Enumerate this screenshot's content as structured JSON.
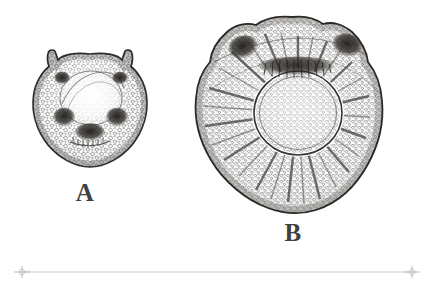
{
  "plate": {
    "background_color": "#ffffff",
    "ink_color": "#3d3b39",
    "width": 434,
    "height": 291,
    "medium": "engraving",
    "subject": "two cellular cross-sections"
  },
  "figures": [
    {
      "id": "A",
      "label": "A",
      "label_x": 85,
      "label_y": 193,
      "center_x": 90,
      "center_y": 114,
      "radius_x": 56,
      "radius_y": 60,
      "outline": "rounded body with two horn-like protrusions at the upper left and upper right",
      "texture": "dense stippled cellular parenchyma",
      "features": [
        {
          "name": "left-ocellus",
          "cx": 62,
          "cy": 78,
          "rx": 7,
          "ry": 6,
          "tone": "dark"
        },
        {
          "name": "right-ocellus",
          "cx": 120,
          "cy": 78,
          "rx": 7,
          "ry": 6,
          "tone": "dark"
        },
        {
          "name": "left-lobe",
          "cx": 64,
          "cy": 117,
          "rx": 10,
          "ry": 9,
          "tone": "dark"
        },
        {
          "name": "right-lobe",
          "cx": 117,
          "cy": 117,
          "rx": 10,
          "ry": 9,
          "tone": "dark"
        },
        {
          "name": "basal-mass",
          "cx": 90,
          "cy": 131,
          "rx": 14,
          "ry": 9,
          "tone": "dark"
        },
        {
          "name": "central-dome",
          "cx": 91,
          "cy": 98,
          "rx": 31,
          "ry": 27,
          "tone": "light"
        }
      ]
    },
    {
      "id": "B",
      "label": "B",
      "label_x": 293,
      "label_y": 233,
      "center_x": 292,
      "center_y": 115,
      "radius_x": 84,
      "radius_y": 100,
      "outline": "large lobed subcircular body with an undulate crown",
      "texture": "dense stippled cellular parenchyma with radiating files",
      "features": [
        {
          "name": "left-ocellus",
          "cx": 243,
          "cy": 47,
          "rx": 13,
          "ry": 10,
          "tone": "dark"
        },
        {
          "name": "right-ocellus",
          "cx": 347,
          "cy": 45,
          "rx": 13,
          "ry": 10,
          "tone": "dark"
        },
        {
          "name": "upper-dark-band",
          "cx": 296,
          "cy": 66,
          "rx": 36,
          "ry": 9,
          "tone": "dark"
        },
        {
          "name": "central-vesicle",
          "cx": 298,
          "cy": 113,
          "rx": 42,
          "ry": 40,
          "tone": "light"
        },
        {
          "name": "radiating-rays",
          "count": 26,
          "tone": "medium"
        }
      ]
    }
  ],
  "scale_bar": {
    "name": "scale-bar",
    "x_start": 22,
    "x_end": 412,
    "y": 272,
    "color": "#c9c9c9",
    "end_marker": "diamond",
    "label": ""
  }
}
